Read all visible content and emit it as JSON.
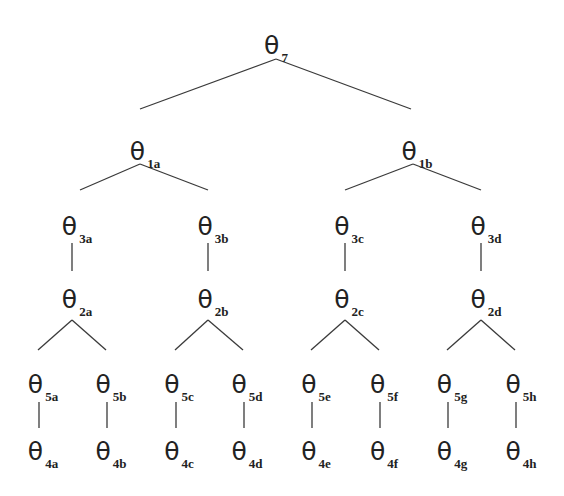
{
  "diagram": {
    "type": "tree",
    "symbol": "θ",
    "nodes": [
      {
        "id": "7",
        "sub": "7",
        "x": 276,
        "y": 45
      },
      {
        "id": "1a",
        "sub": "1a",
        "x": 145,
        "y": 151
      },
      {
        "id": "1b",
        "sub": "1b",
        "x": 417,
        "y": 151
      },
      {
        "id": "3a",
        "sub": "3a",
        "x": 77,
        "y": 226
      },
      {
        "id": "3b",
        "sub": "3b",
        "x": 213,
        "y": 226
      },
      {
        "id": "3c",
        "sub": "3c",
        "x": 349,
        "y": 226
      },
      {
        "id": "3d",
        "sub": "3d",
        "x": 486,
        "y": 226
      },
      {
        "id": "2a",
        "sub": "2a",
        "x": 77,
        "y": 299
      },
      {
        "id": "2b",
        "sub": "2b",
        "x": 213,
        "y": 299
      },
      {
        "id": "2c",
        "sub": "2c",
        "x": 349,
        "y": 299
      },
      {
        "id": "2d",
        "sub": "2d",
        "x": 486,
        "y": 299
      },
      {
        "id": "5a",
        "sub": "5a",
        "x": 43,
        "y": 384
      },
      {
        "id": "5b",
        "sub": "5b",
        "x": 111,
        "y": 384
      },
      {
        "id": "5c",
        "sub": "5c",
        "x": 179,
        "y": 384
      },
      {
        "id": "5d",
        "sub": "5d",
        "x": 247,
        "y": 384
      },
      {
        "id": "5e",
        "sub": "5e",
        "x": 316,
        "y": 384
      },
      {
        "id": "5f",
        "sub": "5f",
        "x": 384,
        "y": 384
      },
      {
        "id": "5g",
        "sub": "5g",
        "x": 452,
        "y": 384
      },
      {
        "id": "5h",
        "sub": "5h",
        "x": 521,
        "y": 384
      },
      {
        "id": "4a",
        "sub": "4a",
        "x": 43,
        "y": 451
      },
      {
        "id": "4b",
        "sub": "4b",
        "x": 111,
        "y": 451
      },
      {
        "id": "4c",
        "sub": "4c",
        "x": 179,
        "y": 451
      },
      {
        "id": "4d",
        "sub": "4d",
        "x": 247,
        "y": 451
      },
      {
        "id": "4e",
        "sub": "4e",
        "x": 316,
        "y": 451
      },
      {
        "id": "4f",
        "sub": "4f",
        "x": 384,
        "y": 451
      },
      {
        "id": "4g",
        "sub": "4g",
        "x": 452,
        "y": 451
      },
      {
        "id": "4h",
        "sub": "4h",
        "x": 521,
        "y": 451
      }
    ],
    "edges": [
      {
        "from": "7",
        "to": "1a",
        "x1": 276,
        "y1": 59,
        "x2": 140,
        "y2": 109
      },
      {
        "from": "7",
        "to": "1b",
        "x1": 276,
        "y1": 59,
        "x2": 411,
        "y2": 109
      },
      {
        "from": "1a",
        "to": "3a",
        "x1": 140,
        "y1": 164,
        "x2": 80,
        "y2": 190
      },
      {
        "from": "1a",
        "to": "3b",
        "x1": 140,
        "y1": 164,
        "x2": 208,
        "y2": 190
      },
      {
        "from": "1b",
        "to": "3c",
        "x1": 413,
        "y1": 164,
        "x2": 345,
        "y2": 190
      },
      {
        "from": "1b",
        "to": "3d",
        "x1": 413,
        "y1": 164,
        "x2": 481,
        "y2": 190
      },
      {
        "from": "3a",
        "to": "2a",
        "x1": 72,
        "y1": 243,
        "x2": 72,
        "y2": 271
      },
      {
        "from": "3b",
        "to": "2b",
        "x1": 208,
        "y1": 243,
        "x2": 208,
        "y2": 271
      },
      {
        "from": "3c",
        "to": "2c",
        "x1": 345,
        "y1": 243,
        "x2": 345,
        "y2": 271
      },
      {
        "from": "3d",
        "to": "2d",
        "x1": 481,
        "y1": 243,
        "x2": 481,
        "y2": 271
      },
      {
        "from": "2a",
        "to": "5a",
        "x1": 72,
        "y1": 320,
        "x2": 38,
        "y2": 350
      },
      {
        "from": "2a",
        "to": "5b",
        "x1": 72,
        "y1": 320,
        "x2": 106,
        "y2": 350
      },
      {
        "from": "2b",
        "to": "5c",
        "x1": 208,
        "y1": 320,
        "x2": 175,
        "y2": 350
      },
      {
        "from": "2b",
        "to": "5d",
        "x1": 208,
        "y1": 320,
        "x2": 243,
        "y2": 350
      },
      {
        "from": "2c",
        "to": "5e",
        "x1": 345,
        "y1": 320,
        "x2": 311,
        "y2": 350
      },
      {
        "from": "2c",
        "to": "5f",
        "x1": 345,
        "y1": 320,
        "x2": 379,
        "y2": 350
      },
      {
        "from": "2d",
        "to": "5g",
        "x1": 481,
        "y1": 320,
        "x2": 447,
        "y2": 350
      },
      {
        "from": "2d",
        "to": "5h",
        "x1": 481,
        "y1": 320,
        "x2": 515,
        "y2": 350
      },
      {
        "from": "5a",
        "to": "4a",
        "x1": 39,
        "y1": 402,
        "x2": 39,
        "y2": 428
      },
      {
        "from": "5b",
        "to": "4b",
        "x1": 107,
        "y1": 402,
        "x2": 107,
        "y2": 428
      },
      {
        "from": "5c",
        "to": "4c",
        "x1": 176,
        "y1": 402,
        "x2": 176,
        "y2": 428
      },
      {
        "from": "5d",
        "to": "4d",
        "x1": 244,
        "y1": 402,
        "x2": 244,
        "y2": 428
      },
      {
        "from": "5e",
        "to": "4e",
        "x1": 312,
        "y1": 402,
        "x2": 312,
        "y2": 428
      },
      {
        "from": "5f",
        "to": "4f",
        "x1": 380,
        "y1": 402,
        "x2": 380,
        "y2": 428
      },
      {
        "from": "5g",
        "to": "4g",
        "x1": 448,
        "y1": 402,
        "x2": 448,
        "y2": 428
      },
      {
        "from": "5h",
        "to": "4h",
        "x1": 516,
        "y1": 402,
        "x2": 516,
        "y2": 428
      }
    ]
  }
}
